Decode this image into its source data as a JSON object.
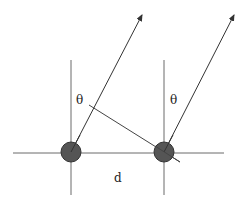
{
  "diagram": {
    "type": "antenna-array-geometry",
    "labels": {
      "theta_left": "θ",
      "theta_right": "θ",
      "spacing": "d"
    },
    "colors": {
      "line": "#6a6a6a",
      "arrow": "#333333",
      "element_fill": "#555555",
      "element_stroke": "#333333"
    },
    "elements": [
      {
        "name": "left-element",
        "cx": 71,
        "cy": 152,
        "r": 10
      },
      {
        "name": "right-element",
        "cx": 164,
        "cy": 152,
        "r": 10
      }
    ]
  }
}
